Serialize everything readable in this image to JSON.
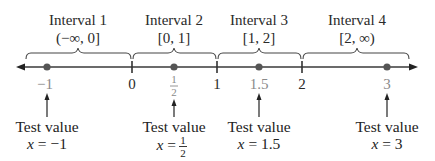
{
  "intervals": [
    {
      "title": "Interval 1",
      "notation": "(−∞, 0]"
    },
    {
      "title": "Interval 2",
      "notation": "[0, 1]"
    },
    {
      "title": "Interval 3",
      "notation": "[1, 2]"
    },
    {
      "title": "Interval 4",
      "notation": "[2, ∞)"
    }
  ],
  "ticks": [
    {
      "label": "0"
    },
    {
      "label": "1"
    },
    {
      "label": "2"
    }
  ],
  "test_points": [
    {
      "label": "−1",
      "caption": "Test value",
      "eq_lhs": "x",
      "eq": " = −1"
    },
    {
      "label_num": "1",
      "label_den": "2",
      "caption": "Test value",
      "eq_lhs": "x",
      "eq": " = ",
      "eq_num": "1",
      "eq_den": "2"
    },
    {
      "label": "1.5",
      "caption": "Test value",
      "eq_lhs": "x",
      "eq": " = 1.5"
    },
    {
      "label": "3",
      "caption": "Test value",
      "eq_lhs": "x",
      "eq": " = 3"
    }
  ],
  "colors": {
    "axis": "#3a3a3a",
    "dot": "#555555",
    "test_label": "#8a8a8a"
  }
}
